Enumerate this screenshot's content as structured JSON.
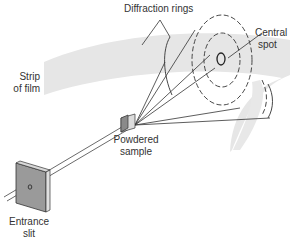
{
  "labels": {
    "diffraction_rings": "Diffraction rings",
    "central_spot_line1": "Central",
    "central_spot_line2": "spot",
    "strip_line1": "Strip",
    "strip_line2": "of film",
    "sample_line1": "Powdered",
    "sample_line2": "sample",
    "slit_line1": "Entrance",
    "slit_line2": "slit"
  },
  "colors": {
    "film": "#e6e6e6",
    "plate_face": "#9a9a9a",
    "plate_edge": "#d8d8d8",
    "lines": "#333333"
  }
}
